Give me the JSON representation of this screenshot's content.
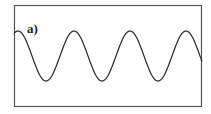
{
  "figure": {
    "panel_label": "a)",
    "frame": {
      "x": 14,
      "y": 5,
      "width": 188,
      "height": 102,
      "stroke": "#555555"
    },
    "wave": {
      "type": "sinusoid",
      "color": "#333333",
      "x_start": 14,
      "x_end": 202,
      "center_y": 56,
      "amplitude_px": 25,
      "period_px": 56,
      "phase_peak_x": 74
    }
  }
}
